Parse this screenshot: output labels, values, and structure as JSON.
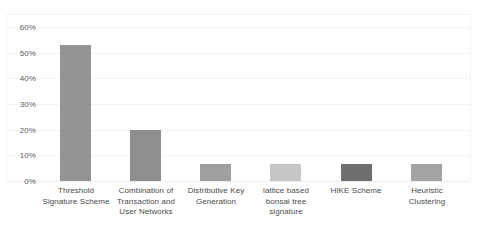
{
  "chart_data": {
    "type": "bar",
    "title": "",
    "subtitle": "",
    "xlabel": "",
    "ylabel": "",
    "categories": [
      "Threshold Signature Scheme",
      "Combination of Transaction and User Networks",
      "Distributive Key Generation",
      "lattice based bonsai tree signature",
      "HIKE Scheme",
      "Heuristic Clustering"
    ],
    "values": [
      53,
      20,
      6.5,
      6.5,
      6.5,
      6.5
    ],
    "value_unit": "%",
    "ylim": [
      0,
      60
    ],
    "ytick_values": [
      0,
      10,
      20,
      30,
      40,
      50,
      60
    ],
    "ytick_labels": [
      "0%",
      "10%",
      "20%",
      "30%",
      "40%",
      "50%",
      "60%"
    ],
    "grid": true,
    "legend": false,
    "legend_position": "none",
    "bar_colors": [
      "#949494",
      "#8f8f8f",
      "#a0a0a0",
      "#c6c6c6",
      "#6f6f6f",
      "#a3a3a3"
    ]
  },
  "axis": {
    "y_ticks": [
      {
        "label": "60%",
        "value": 60
      },
      {
        "label": "50%",
        "value": 50
      },
      {
        "label": "40%",
        "value": 40
      },
      {
        "label": "30%",
        "value": 30
      },
      {
        "label": "20%",
        "value": 20
      },
      {
        "label": "10%",
        "value": 10
      },
      {
        "label": "0%",
        "value": 0
      }
    ]
  },
  "categories": [
    {
      "lines": [
        "Threshold",
        "Signature Scheme"
      ],
      "value": 53,
      "color": "#949494"
    },
    {
      "lines": [
        "Combination of",
        "Transaction and",
        "User Networks"
      ],
      "value": 20,
      "color": "#8f8f8f"
    },
    {
      "lines": [
        "Distributive Key",
        "Generation"
      ],
      "value": 6.5,
      "color": "#a0a0a0"
    },
    {
      "lines": [
        "lattice based",
        "bonsai tree",
        "signature"
      ],
      "value": 6.5,
      "color": "#c6c6c6"
    },
    {
      "lines": [
        "HIKE Scheme"
      ],
      "value": 6.5,
      "color": "#6f6f6f"
    },
    {
      "lines": [
        "Heuristic",
        "Clustering"
      ],
      "value": 6.5,
      "color": "#a3a3a3"
    }
  ]
}
